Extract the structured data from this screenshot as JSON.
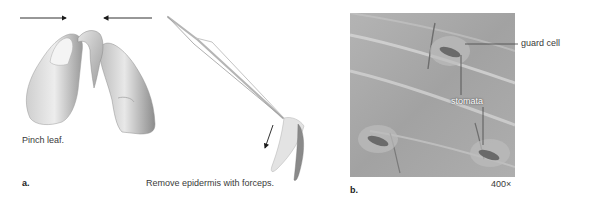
{
  "figure": {
    "panel_a": {
      "letter": "a.",
      "step1_caption": "Pinch leaf.",
      "step2_caption": "Remove epidermis with forceps."
    },
    "panel_b": {
      "letter": "b.",
      "magnification": "400×",
      "labels": {
        "guard_cell": "guard cell",
        "stomata": "stomata"
      }
    }
  },
  "colors": {
    "arrow": "#1a1a1a",
    "micrograph_base": "#a9a9a9",
    "leader_line": "#444444"
  }
}
